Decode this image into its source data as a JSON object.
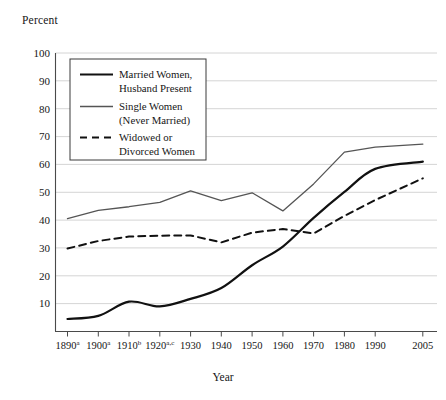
{
  "figure": {
    "y_axis_title": "Percent",
    "x_axis_title": "Year"
  },
  "legend": {
    "items": [
      {
        "label_line1": "Married Women,",
        "label_line2": "Husband Present",
        "style": "solid-thick",
        "color": "#111111"
      },
      {
        "label_line1": "Single Women",
        "label_line2": "(Never Married)",
        "style": "solid-thin",
        "color": "#555555"
      },
      {
        "label_line1": "Widowed or",
        "label_line2": "Divorced Women",
        "style": "dashed",
        "color": "#111111"
      }
    ]
  },
  "axis": {
    "y_ticks": [
      "10",
      "20",
      "30",
      "40",
      "50",
      "60",
      "70",
      "80",
      "90",
      "100"
    ],
    "x_ticks": [
      {
        "year": "1890",
        "sup": "a"
      },
      {
        "year": "1900",
        "sup": "a"
      },
      {
        "year": "1910",
        "sup": "b"
      },
      {
        "year": "1920",
        "sup": "a,c"
      },
      {
        "year": "1930",
        "sup": ""
      },
      {
        "year": "1940",
        "sup": ""
      },
      {
        "year": "1950",
        "sup": ""
      },
      {
        "year": "1960",
        "sup": ""
      },
      {
        "year": "1970",
        "sup": ""
      },
      {
        "year": "1980",
        "sup": ""
      },
      {
        "year": "1990",
        "sup": ""
      },
      {
        "year": "2005",
        "sup": ""
      }
    ]
  },
  "chart_data": {
    "type": "line",
    "title": "",
    "xlabel": "Year",
    "ylabel": "Percent",
    "ylim": [
      0,
      100
    ],
    "grid": true,
    "legend_position": "upper-left-inside",
    "categories": [
      "1890",
      "1900",
      "1910",
      "1920",
      "1930",
      "1940",
      "1950",
      "1960",
      "1970",
      "1980",
      "1990",
      "2005"
    ],
    "series": [
      {
        "name": "Married Women, Husband Present",
        "color": "#111111",
        "style": "solid-thick",
        "values": [
          4.5,
          5.6,
          10.7,
          9.0,
          11.7,
          15.6,
          23.8,
          30.5,
          40.8,
          50.1,
          58.4,
          61.0
        ]
      },
      {
        "name": "Single Women (Never Married)",
        "color": "#555555",
        "style": "solid-thin",
        "values": [
          40.5,
          43.5,
          44.8,
          46.4,
          50.5,
          47.0,
          49.8,
          43.3,
          53.0,
          64.4,
          66.2,
          67.3
        ]
      },
      {
        "name": "Widowed or Divorced Women",
        "color": "#111111",
        "style": "dashed",
        "values": [
          29.8,
          32.5,
          34.1,
          34.4,
          34.5,
          32.0,
          35.5,
          36.8,
          35.2,
          41.5,
          47.2,
          55.0
        ]
      }
    ]
  },
  "colors": {
    "grid": "#c9c9c9",
    "axis": "#4a4a4a",
    "text": "#161616",
    "series_married": "#111111",
    "series_single": "#555555",
    "series_widowed": "#111111"
  }
}
